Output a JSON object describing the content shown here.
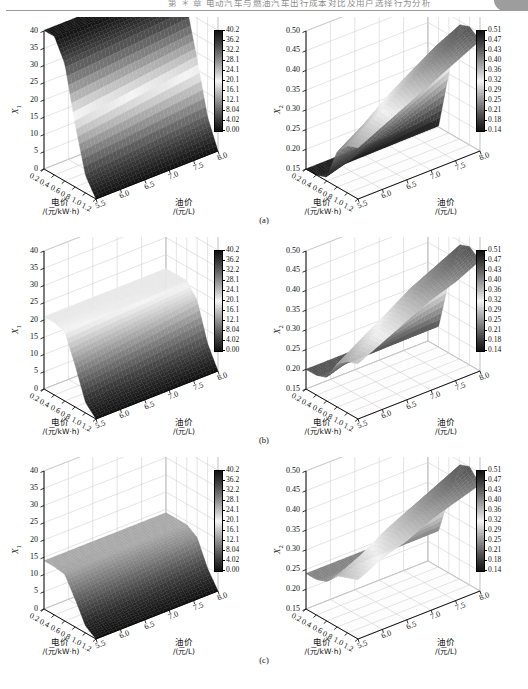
{
  "page_header": {
    "running_head": "第 ＊ 章  电动汽车与燃油汽车出行成本对比及用户选择行为分析",
    "corner_tab": ""
  },
  "figure": {
    "panels": [
      {
        "key": "a",
        "caption": "(a)"
      },
      {
        "key": "b",
        "caption": "(b)"
      },
      {
        "key": "c",
        "caption": "(c)"
      }
    ],
    "axis": {
      "x_name": "电价",
      "x_unit": "/(元/kW·h)",
      "y_name": "油价",
      "y_unit": "/(元/L)",
      "z_name_left": "X",
      "z_sub_left": "1",
      "z_name_right": "X",
      "z_sub_right": "2"
    },
    "colors": {
      "surface_low": "#000000",
      "surface_mid": "#ffffff",
      "surface_high": "#000000",
      "grid": "#c9c9c9",
      "axis": "#000000",
      "wall": "#ffffff"
    }
  },
  "chart_data": [
    {
      "id": "a-left",
      "type": "surface",
      "panel": "(a)",
      "title": "",
      "xlabel": "电价 /(元/kW·h)",
      "ylabel": "油价 /(元/L)",
      "zlabel": "X1",
      "xticks": [
        "0.2",
        "0.4",
        "0.6",
        "0.8",
        "1.0",
        "1.2"
      ],
      "yticks": [
        "5.5",
        "6.0",
        "6.5",
        "7.0",
        "7.5",
        "8.0"
      ],
      "zticks": [
        "0",
        "5",
        "10",
        "15",
        "20",
        "25",
        "30",
        "35",
        "40"
      ],
      "xlim": [
        0.2,
        1.2
      ],
      "ylim": [
        5.5,
        8.0
      ],
      "zlim": [
        0,
        40
      ],
      "grid": true,
      "colorbar": {
        "ticks": [
          "40.2",
          "36.2",
          "32.2",
          "28.1",
          "24.1",
          "20.1",
          "16.1",
          "12.1",
          "8.04",
          "4.02",
          "0.00"
        ],
        "vmin": 0.0,
        "vmax": 40.2
      },
      "description": "高原面约 40（低电价侧），沿电价增大急剧跌至 0",
      "plateau_value": 40,
      "z_grid": [
        [
          40.2,
          40.2,
          40.2,
          40.2,
          40.2,
          40.2
        ],
        [
          40.2,
          40.2,
          40.2,
          40.2,
          40.2,
          40.2
        ],
        [
          34.0,
          34.5,
          35.0,
          35.5,
          36.0,
          36.5
        ],
        [
          18.0,
          19.0,
          20.0,
          21.0,
          22.0,
          23.0
        ],
        [
          5.0,
          5.6,
          6.2,
          6.9,
          7.5,
          8.1
        ],
        [
          0.0,
          0.0,
          0.0,
          0.0,
          0.0,
          0.0
        ]
      ]
    },
    {
      "id": "a-right",
      "type": "surface",
      "panel": "(a)",
      "title": "",
      "xlabel": "电价 /(元/kW·h)",
      "ylabel": "油价 /(元/L)",
      "zlabel": "X2",
      "xticks": [
        "0.2",
        "0.4",
        "0.6",
        "0.8",
        "1.0",
        "1.2"
      ],
      "yticks": [
        "5.5",
        "6.0",
        "6.5",
        "7.0",
        "7.5",
        "8.0"
      ],
      "zticks": [
        "0.15",
        "0.20",
        "0.25",
        "0.30",
        "0.35",
        "0.40",
        "0.45",
        "0.50"
      ],
      "xlim": [
        0.2,
        1.2
      ],
      "ylim": [
        5.5,
        8.0
      ],
      "zlim": [
        0.15,
        0.5
      ],
      "grid": true,
      "colorbar": {
        "ticks": [
          "0.51",
          "0.47",
          "0.43",
          "0.40",
          "0.36",
          "0.32",
          "0.29",
          "0.25",
          "0.21",
          "0.18",
          "0.14"
        ],
        "vmin": 0.14,
        "vmax": 0.51
      },
      "description": "低电价处平台约 0.15，随电价上升到峰值约 0.45",
      "plateau_value": 0.15,
      "peak_value": 0.45,
      "z_grid": [
        [
          0.15,
          0.15,
          0.15,
          0.15,
          0.15,
          0.15
        ],
        [
          0.15,
          0.15,
          0.15,
          0.15,
          0.15,
          0.15
        ],
        [
          0.16,
          0.18,
          0.21,
          0.24,
          0.27,
          0.3
        ],
        [
          0.24,
          0.28,
          0.33,
          0.37,
          0.41,
          0.44
        ],
        [
          0.27,
          0.31,
          0.35,
          0.39,
          0.42,
          0.45
        ],
        [
          0.28,
          0.31,
          0.34,
          0.37,
          0.4,
          0.43
        ]
      ]
    },
    {
      "id": "b-left",
      "type": "surface",
      "panel": "(b)",
      "title": "",
      "xlabel": "电价 /(元/kW·h)",
      "ylabel": "油价 /(元/L)",
      "zlabel": "X1",
      "xticks": [
        "0.2",
        "0.4",
        "0.6",
        "0.8",
        "1.0",
        "1.2"
      ],
      "yticks": [
        "5.5",
        "6.0",
        "6.5",
        "7.0",
        "7.5",
        "8.0"
      ],
      "zticks": [
        "0",
        "5",
        "10",
        "15",
        "20",
        "25",
        "30",
        "35",
        "40"
      ],
      "xlim": [
        0.2,
        1.2
      ],
      "ylim": [
        5.5,
        8.0
      ],
      "zlim": [
        0,
        40
      ],
      "grid": true,
      "colorbar": {
        "ticks": [
          "40.2",
          "36.2",
          "32.2",
          "28.1",
          "24.1",
          "20.1",
          "16.1",
          "12.1",
          "8.04",
          "4.02",
          "0.00"
        ],
        "vmin": 0.0,
        "vmax": 40.2
      },
      "description": "高原面约 21，随电价增大跌至 0",
      "plateau_value": 21,
      "z_grid": [
        [
          21.0,
          21.0,
          21.0,
          21.0,
          21.0,
          21.0
        ],
        [
          21.0,
          21.0,
          21.0,
          21.0,
          21.0,
          21.0
        ],
        [
          20.0,
          20.3,
          20.6,
          20.8,
          21.0,
          21.0
        ],
        [
          12.0,
          13.0,
          14.0,
          15.0,
          16.0,
          17.0
        ],
        [
          3.0,
          3.6,
          4.2,
          4.8,
          5.5,
          6.2
        ],
        [
          0.0,
          0.0,
          0.0,
          0.0,
          0.0,
          0.0
        ]
      ]
    },
    {
      "id": "b-right",
      "type": "surface",
      "panel": "(b)",
      "title": "",
      "xlabel": "电价 /(元/kW·h)",
      "ylabel": "油价 /(元/L)",
      "zlabel": "X2",
      "xticks": [
        "0.2",
        "0.4",
        "0.6",
        "0.8",
        "1.0",
        "1.2"
      ],
      "yticks": [
        "5.5",
        "6.0",
        "6.5",
        "7.0",
        "7.5",
        "8.0"
      ],
      "zticks": [
        "0.15",
        "0.20",
        "0.25",
        "0.30",
        "0.35",
        "0.40",
        "0.45",
        "0.50"
      ],
      "xlim": [
        0.2,
        1.2
      ],
      "ylim": [
        5.5,
        8.0
      ],
      "zlim": [
        0.15,
        0.5
      ],
      "grid": true,
      "colorbar": {
        "ticks": [
          "0.51",
          "0.47",
          "0.43",
          "0.40",
          "0.36",
          "0.32",
          "0.29",
          "0.25",
          "0.21",
          "0.18",
          "0.14"
        ],
        "vmin": 0.14,
        "vmax": 0.51
      },
      "description": "低电价平台约 0.20，峰值约 0.45",
      "plateau_value": 0.2,
      "peak_value": 0.45,
      "z_grid": [
        [
          0.2,
          0.2,
          0.2,
          0.2,
          0.2,
          0.2
        ],
        [
          0.2,
          0.2,
          0.2,
          0.2,
          0.2,
          0.2
        ],
        [
          0.21,
          0.23,
          0.25,
          0.28,
          0.31,
          0.33
        ],
        [
          0.26,
          0.3,
          0.34,
          0.38,
          0.41,
          0.44
        ],
        [
          0.28,
          0.32,
          0.35,
          0.39,
          0.42,
          0.45
        ],
        [
          0.29,
          0.32,
          0.35,
          0.38,
          0.4,
          0.43
        ]
      ]
    },
    {
      "id": "c-left",
      "type": "surface",
      "panel": "(c)",
      "title": "",
      "xlabel": "电价 /(元/kW·h)",
      "ylabel": "油价 /(元/L)",
      "zlabel": "X1",
      "xticks": [
        "0.2",
        "0.4",
        "0.6",
        "0.8",
        "1.0",
        "1.2"
      ],
      "yticks": [
        "5.5",
        "6.0",
        "6.5",
        "7.0",
        "7.5",
        "8.0"
      ],
      "zticks": [
        "0",
        "5",
        "10",
        "15",
        "20",
        "25",
        "30",
        "35",
        "40"
      ],
      "xlim": [
        0.2,
        1.2
      ],
      "ylim": [
        5.5,
        8.0
      ],
      "zlim": [
        0,
        40
      ],
      "grid": true,
      "colorbar": {
        "ticks": [
          "40.2",
          "36.2",
          "32.2",
          "28.1",
          "24.1",
          "20.1",
          "16.1",
          "12.1",
          "8.04",
          "4.02",
          "0.00"
        ],
        "vmin": 0.0,
        "vmax": 40.2
      },
      "description": "高原面约 14，随电价增大跌至 0",
      "plateau_value": 14,
      "z_grid": [
        [
          14.0,
          14.0,
          14.0,
          14.0,
          14.0,
          14.0
        ],
        [
          14.0,
          14.0,
          14.0,
          14.0,
          14.0,
          14.0
        ],
        [
          13.5,
          13.7,
          13.9,
          14.0,
          14.0,
          14.0
        ],
        [
          8.0,
          8.8,
          9.6,
          10.4,
          11.2,
          12.0
        ],
        [
          2.0,
          2.5,
          3.0,
          3.6,
          4.2,
          4.8
        ],
        [
          0.0,
          0.0,
          0.0,
          0.0,
          0.0,
          0.0
        ]
      ]
    },
    {
      "id": "c-right",
      "type": "surface",
      "panel": "(c)",
      "title": "",
      "xlabel": "电价 /(元/kW·h)",
      "ylabel": "油价 /(元/L)",
      "zlabel": "X2",
      "xticks": [
        "0.2",
        "0.4",
        "0.6",
        "0.8",
        "1.0",
        "1.2"
      ],
      "yticks": [
        "5.5",
        "6.0",
        "6.5",
        "7.0",
        "7.5",
        "8.0"
      ],
      "zticks": [
        "0.15",
        "0.20",
        "0.25",
        "0.30",
        "0.35",
        "0.40",
        "0.45",
        "0.50"
      ],
      "xlim": [
        0.2,
        1.2
      ],
      "ylim": [
        5.5,
        8.0
      ],
      "zlim": [
        0.15,
        0.5
      ],
      "grid": true,
      "colorbar": {
        "ticks": [
          "0.51",
          "0.47",
          "0.43",
          "0.40",
          "0.36",
          "0.32",
          "0.29",
          "0.25",
          "0.21",
          "0.18",
          "0.14"
        ],
        "vmin": 0.14,
        "vmax": 0.51
      },
      "description": "低电价平台约 0.24，峰值约 0.45",
      "plateau_value": 0.24,
      "peak_value": 0.45,
      "z_grid": [
        [
          0.24,
          0.24,
          0.24,
          0.24,
          0.24,
          0.24
        ],
        [
          0.24,
          0.24,
          0.24,
          0.24,
          0.24,
          0.24
        ],
        [
          0.25,
          0.26,
          0.28,
          0.3,
          0.32,
          0.34
        ],
        [
          0.28,
          0.31,
          0.35,
          0.38,
          0.41,
          0.44
        ],
        [
          0.29,
          0.32,
          0.36,
          0.39,
          0.42,
          0.45
        ],
        [
          0.3,
          0.33,
          0.35,
          0.38,
          0.4,
          0.42
        ]
      ]
    }
  ]
}
